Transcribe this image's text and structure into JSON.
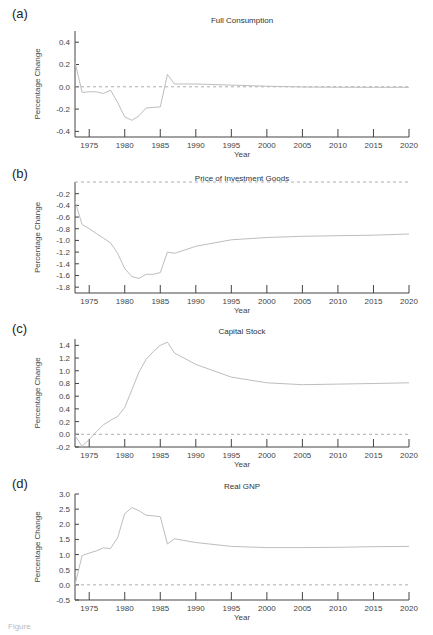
{
  "figure": {
    "caption_fragment": "Figure"
  },
  "chart_data": [
    {
      "panel": "(a)",
      "type": "line",
      "title": "Full Consumption",
      "xlabel": "Year",
      "ylabel": "Percentage Change",
      "xlim": [
        1973,
        2020
      ],
      "ylim": [
        -0.45,
        0.5
      ],
      "xticks": [
        1975,
        1980,
        1985,
        1990,
        1995,
        2000,
        2005,
        2010,
        2015,
        2020
      ],
      "yticks": [
        0.4,
        0.2,
        0.0,
        -0.2,
        -0.4
      ],
      "ytick_labels": [
        "0.4",
        "0.2",
        "0.0",
        "-0.2",
        "-0.4"
      ],
      "reference_line": 0.0,
      "x": [
        1973,
        1974,
        1975,
        1976,
        1977,
        1978,
        1979,
        1980,
        1981,
        1982,
        1983,
        1984,
        1985,
        1986,
        1987,
        1990,
        1995,
        2000,
        2005,
        2010,
        2015,
        2020
      ],
      "values": [
        0.22,
        -0.05,
        -0.045,
        -0.045,
        -0.06,
        -0.03,
        -0.14,
        -0.27,
        -0.3,
        -0.26,
        -0.19,
        -0.185,
        -0.18,
        0.11,
        0.025,
        0.025,
        0.015,
        0.005,
        -0.002,
        -0.004,
        -0.005,
        -0.005
      ]
    },
    {
      "panel": "(b)",
      "type": "line",
      "title": "Price of Investment Goods",
      "xlabel": "Year",
      "ylabel": "Percentage Change",
      "xlim": [
        1973,
        2020
      ],
      "ylim": [
        -1.9,
        0.0
      ],
      "xticks": [
        1975,
        1980,
        1985,
        1990,
        1995,
        2000,
        2005,
        2010,
        2015,
        2020
      ],
      "yticks": [
        -0.2,
        -0.4,
        -0.6,
        -0.8,
        -1.0,
        -1.2,
        -1.4,
        -1.6,
        -1.8
      ],
      "ytick_labels": [
        "-0.2",
        "-0.4",
        "-0.6",
        "-0.8",
        "-1.0",
        "-1.2",
        "-1.4",
        "-1.6",
        "-1.8"
      ],
      "reference_line": 0.0,
      "x": [
        1973,
        1974,
        1975,
        1976,
        1977,
        1978,
        1979,
        1980,
        1981,
        1982,
        1983,
        1984,
        1985,
        1986,
        1987,
        1990,
        1995,
        2000,
        2005,
        2010,
        2015,
        2020
      ],
      "values": [
        -0.33,
        -0.73,
        -0.8,
        -0.88,
        -0.96,
        -1.04,
        -1.22,
        -1.48,
        -1.62,
        -1.65,
        -1.58,
        -1.58,
        -1.55,
        -1.2,
        -1.22,
        -1.1,
        -0.99,
        -0.95,
        -0.93,
        -0.92,
        -0.91,
        -0.89
      ]
    },
    {
      "panel": "(c)",
      "type": "line",
      "title": "Capital Stock",
      "xlabel": "Year",
      "ylabel": "Percentage Change",
      "xlim": [
        1973,
        2020
      ],
      "ylim": [
        -0.2,
        1.5
      ],
      "xticks": [
        1975,
        1980,
        1985,
        1990,
        1995,
        2000,
        2005,
        2010,
        2015,
        2020
      ],
      "yticks": [
        1.4,
        1.2,
        1.0,
        0.8,
        0.6,
        0.4,
        0.2,
        0.0,
        -0.2
      ],
      "ytick_labels": [
        "1.4",
        "1.2",
        "1.0",
        "0.8",
        "0.6",
        "0.4",
        "0.2",
        "0.0",
        "-0.2"
      ],
      "reference_line": 0.0,
      "x": [
        1973,
        1974,
        1975,
        1976,
        1977,
        1978,
        1979,
        1980,
        1981,
        1982,
        1983,
        1984,
        1985,
        1986,
        1987,
        1990,
        1995,
        2000,
        2005,
        2010,
        2015,
        2020
      ],
      "values": [
        -0.02,
        -0.19,
        -0.08,
        0.04,
        0.15,
        0.22,
        0.28,
        0.42,
        0.7,
        0.98,
        1.18,
        1.3,
        1.4,
        1.45,
        1.28,
        1.1,
        0.9,
        0.81,
        0.78,
        0.79,
        0.8,
        0.81
      ]
    },
    {
      "panel": "(d)",
      "type": "line",
      "title": "Real GNP",
      "xlabel": "Year",
      "ylabel": "Percentage Change",
      "xlim": [
        1973,
        2020
      ],
      "ylim": [
        -0.5,
        3.0
      ],
      "xticks": [
        1975,
        1980,
        1985,
        1990,
        1995,
        2000,
        2005,
        2010,
        2015,
        2020
      ],
      "yticks": [
        3.0,
        2.5,
        2.0,
        1.5,
        1.0,
        0.5,
        0.0,
        -0.5
      ],
      "ytick_labels": [
        "3.0",
        "2.5",
        "2.0",
        "1.5",
        "1.0",
        "0.5",
        "0.0",
        "-0.5"
      ],
      "reference_line": 0.0,
      "x": [
        1973,
        1974,
        1975,
        1976,
        1977,
        1978,
        1979,
        1980,
        1981,
        1982,
        1983,
        1984,
        1985,
        1986,
        1987,
        1990,
        1995,
        2000,
        2005,
        2010,
        2015,
        2020
      ],
      "values": [
        0.0,
        0.97,
        1.05,
        1.12,
        1.22,
        1.2,
        1.55,
        2.35,
        2.55,
        2.45,
        2.3,
        2.28,
        2.25,
        1.35,
        1.52,
        1.4,
        1.27,
        1.23,
        1.23,
        1.24,
        1.26,
        1.27
      ]
    }
  ]
}
